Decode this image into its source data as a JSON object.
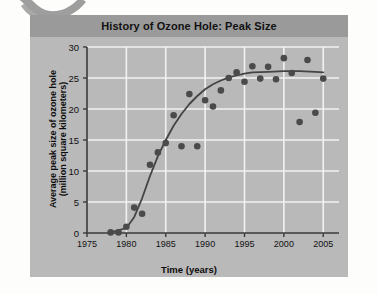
{
  "figure": {
    "title": "History of Ozone Hole: Peak Size",
    "title_band_color": "#9a9a9a",
    "panel_color": "#b9b9b9",
    "page_color": "#fdfdfb"
  },
  "decor": {
    "corner_graphic": "swoosh-arc",
    "color": "#8d8d8d"
  },
  "chart_data": {
    "type": "scatter",
    "title": "History of Ozone Hole: Peak Size",
    "xlabel": "Time (years)",
    "ylabel": "Average peak size of ozone hole (million square kilometers)",
    "ylabel_lines": [
      "Average peak size of ozone hole",
      "(million square kilometers)"
    ],
    "xlim": [
      1975,
      2007
    ],
    "ylim": [
      0,
      30
    ],
    "xticks": [
      1975,
      1980,
      1985,
      1990,
      1995,
      2000,
      2005
    ],
    "yticks": [
      0,
      5,
      10,
      15,
      20,
      25,
      30
    ],
    "grid": true,
    "grid_color": "#f2f2f2",
    "legend": "none",
    "marker_color": "#4a4a4a",
    "trend_line_color": "#444444",
    "x": [
      1978,
      1979,
      1980,
      1981,
      1982,
      1983,
      1984,
      1985,
      1986,
      1987,
      1988,
      1989,
      1990,
      1991,
      1992,
      1993,
      1994,
      1995,
      1996,
      1997,
      1998,
      1999,
      2000,
      2001,
      2002,
      2003,
      2004,
      2005
    ],
    "values": [
      0.1,
      0.1,
      1.0,
      4.1,
      3.1,
      11.0,
      13.0,
      14.5,
      19.0,
      14.0,
      22.4,
      14.0,
      21.4,
      20.4,
      23.0,
      25.0,
      25.9,
      24.4,
      26.9,
      24.9,
      26.8,
      24.8,
      28.2,
      25.8,
      17.9,
      27.9,
      19.4,
      24.9
    ],
    "trend": {
      "description": "logistic S-curve fit rising from 0 near 1978 to plateau near 26 after 1996",
      "x": [
        1978,
        1980,
        1981,
        1982,
        1983,
        1984,
        1985,
        1986,
        1987,
        1988,
        1989,
        1990,
        1991,
        1992,
        1993,
        1994,
        1995,
        1996,
        1998,
        2000,
        2002,
        2004,
        2005
      ],
      "y": [
        0.1,
        0.8,
        2.6,
        5.6,
        9.2,
        12.4,
        15.0,
        17.3,
        19.2,
        20.8,
        22.1,
        23.2,
        24.0,
        24.6,
        25.1,
        25.4,
        25.7,
        25.9,
        26.0,
        26.1,
        26.1,
        26.0,
        25.9
      ]
    }
  },
  "axis": {
    "xtick_labels": [
      "1975",
      "1980",
      "1985",
      "1990",
      "1995",
      "2000",
      "2005"
    ],
    "ytick_labels": [
      "0",
      "5",
      "10",
      "15",
      "20",
      "25",
      "30"
    ]
  }
}
